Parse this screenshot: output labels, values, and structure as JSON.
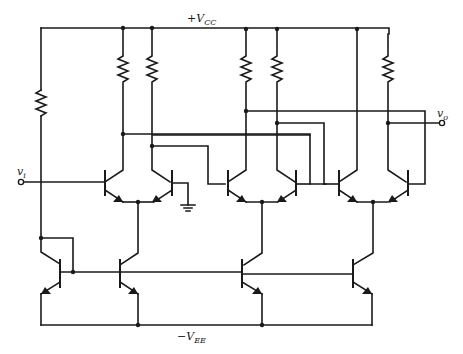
{
  "diagram": {
    "type": "circuit-schematic",
    "labels": {
      "vcc_prefix": "+V",
      "vcc_sub": "CC",
      "vee_prefix": "−V",
      "vee_sub": "EE",
      "vi_main": "v",
      "vi_sub": "i",
      "vo_main": "v",
      "vo_sub": "o"
    },
    "rails": {
      "positive_supply": "+VCC",
      "negative_supply": "-VEE"
    },
    "stages": [
      {
        "name": "stage-1",
        "input": "vi",
        "reference": "ground",
        "load_resistors": 2
      },
      {
        "name": "stage-2",
        "load_resistors": 2
      },
      {
        "name": "stage-3",
        "output": "vo",
        "load_resistors": 1
      }
    ],
    "bias": {
      "reference_resistor": 1,
      "mirror_transistors": 4
    },
    "colors": {
      "ink": "#1a1a1a",
      "background": "#ffffff"
    }
  }
}
